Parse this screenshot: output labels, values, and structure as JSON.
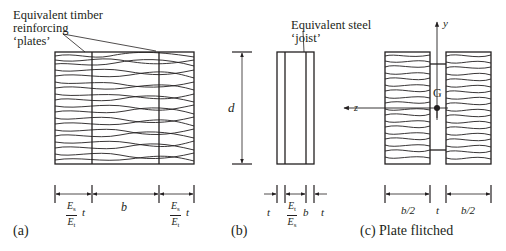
{
  "figure": {
    "panels": [
      {
        "id": "a",
        "caption": "(a)",
        "callout": [
          "Equivalent timber",
          "reinforcing",
          "‘plates’"
        ],
        "dimensions": {
          "left_plate": {
            "num": "E",
            "num_sub": "s",
            "den": "E",
            "den_sub": "t",
            "suffix": "t"
          },
          "middle": "b",
          "right_plate": {
            "num": "E",
            "num_sub": "s",
            "den": "E",
            "den_sub": "t",
            "suffix": "t"
          }
        }
      },
      {
        "id": "b",
        "caption": "(b)",
        "callout": [
          "Equivalent steel",
          "‘joist’"
        ],
        "depth_label": "d",
        "dimensions": {
          "left_plate": "t",
          "middle": {
            "num": "E",
            "num_sub": "t",
            "den": "E",
            "den_sub": "s",
            "suffix": "b"
          },
          "right_plate": "t"
        }
      },
      {
        "id": "c",
        "caption": "(c) Plate flitched",
        "axis_y": "y",
        "axis_z": "z",
        "centroid": "G",
        "dimensions": {
          "left": "b/2",
          "middle": "t",
          "right": "b/2"
        }
      }
    ],
    "colors": {
      "ink": "#231f20",
      "background": "#ffffff"
    }
  }
}
